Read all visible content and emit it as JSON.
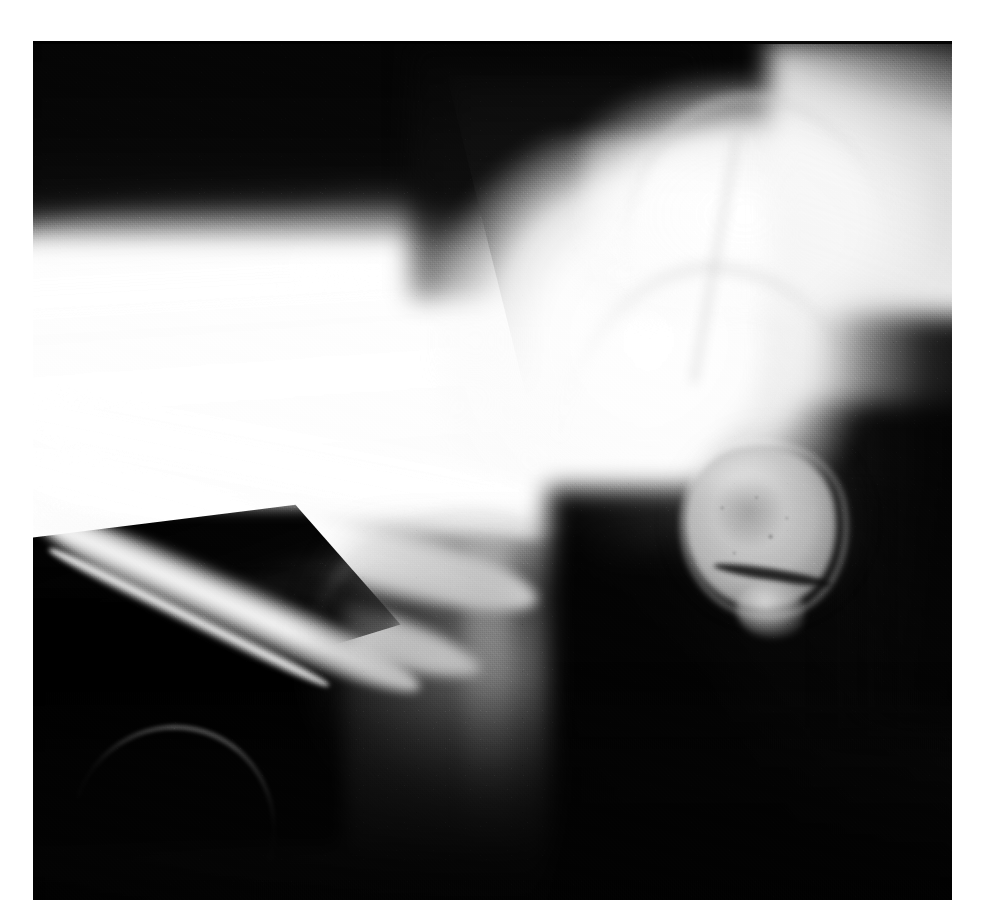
{
  "page": {
    "background_color": "#ffffff",
    "width": 983,
    "height": 923,
    "caption": ""
  },
  "image": {
    "kind": "radiograph",
    "modality": "X-ray",
    "view": "lateral",
    "body_part": "wrist and hand",
    "alt_text": "Lateral radiograph of the wrist showing the distal forearm, carpal bones, metacarpals and a rounded detached carpal bone fragment",
    "frame": {
      "left": 33,
      "top": 41,
      "width": 919,
      "height": 859
    },
    "film_background_color": "#070707",
    "bone_color": "#ffffff",
    "soft_tissue_color": "#8c8c8c"
  },
  "anatomy": {
    "regions": [
      {
        "name": "distal-forearm-shaft",
        "label": "Distal forearm (radius / ulna)",
        "density": "high"
      },
      {
        "name": "proximal-hump",
        "label": "Dorsal cortical prominence",
        "density": "high"
      },
      {
        "name": "v-notch",
        "label": "Dorsal soft-tissue notch",
        "density": "low"
      },
      {
        "name": "carpal-mass",
        "label": "Carpal bone block",
        "density": "high"
      },
      {
        "name": "pisiform-fragment",
        "label": "Rounded carpal bone fragment",
        "density": "medium"
      },
      {
        "name": "second-fragment",
        "label": "Small adjacent bone fragment",
        "density": "medium"
      },
      {
        "name": "metacarpal-shafts",
        "label": "Metacarpal shafts",
        "density": "high"
      },
      {
        "name": "thumb-shaft",
        "label": "First metacarpal / thumb ray",
        "density": "medium"
      },
      {
        "name": "soft-tissue-mass",
        "label": "Hypothenar soft tissue shadow",
        "density": "low"
      },
      {
        "name": "background-field",
        "label": "Exposed film background",
        "density": "none"
      }
    ]
  },
  "overlay": {
    "annotations": [],
    "markers": [],
    "measurements": []
  }
}
